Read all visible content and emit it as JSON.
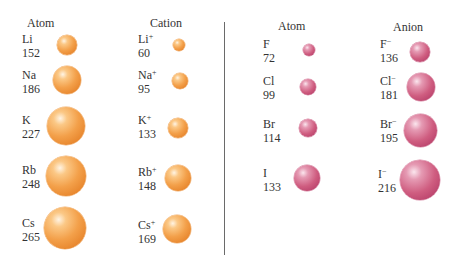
{
  "left_panel": {
    "col1_header": "Atom",
    "col2_header": "Cation",
    "color": "#f0a040",
    "rows": [
      {
        "atom": {
          "symbol": "Li",
          "radius_pm": "152"
        },
        "ion": {
          "symbol": "Li",
          "charge": "+",
          "radius_pm": "60"
        }
      },
      {
        "atom": {
          "symbol": "Na",
          "radius_pm": "186"
        },
        "ion": {
          "symbol": "Na",
          "charge": "+",
          "radius_pm": "95"
        }
      },
      {
        "atom": {
          "symbol": "K",
          "radius_pm": "227"
        },
        "ion": {
          "symbol": "K",
          "charge": "+",
          "radius_pm": "133"
        }
      },
      {
        "atom": {
          "symbol": "Rb",
          "radius_pm": "248"
        },
        "ion": {
          "symbol": "Rb",
          "charge": "+",
          "radius_pm": "148"
        }
      },
      {
        "atom": {
          "symbol": "Cs",
          "radius_pm": "265"
        },
        "ion": {
          "symbol": "Cs",
          "charge": "+",
          "radius_pm": "169"
        }
      }
    ]
  },
  "right_panel": {
    "col1_header": "Atom",
    "col2_header": "Anion",
    "color": "#c8537a",
    "rows": [
      {
        "atom": {
          "symbol": "F",
          "radius_pm": "72"
        },
        "ion": {
          "symbol": "F",
          "charge": "−",
          "radius_pm": "136"
        }
      },
      {
        "atom": {
          "symbol": "Cl",
          "radius_pm": "99"
        },
        "ion": {
          "symbol": "Cl",
          "charge": "−",
          "radius_pm": "181"
        }
      },
      {
        "atom": {
          "symbol": "Br",
          "radius_pm": "114"
        },
        "ion": {
          "symbol": "Br",
          "charge": "−",
          "radius_pm": "195"
        }
      },
      {
        "atom": {
          "symbol": "I",
          "radius_pm": "133"
        },
        "ion": {
          "symbol": "I",
          "charge": "−",
          "radius_pm": "216"
        }
      }
    ]
  }
}
